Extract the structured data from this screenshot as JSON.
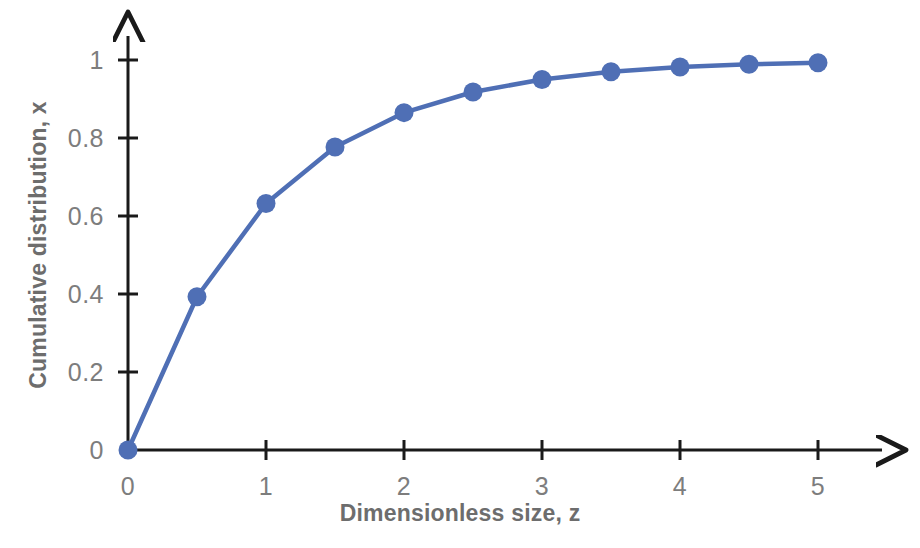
{
  "chart_data": {
    "type": "line",
    "title": "",
    "xlabel": "Dimensionless size, z",
    "ylabel": "Cumulative distribution, x",
    "x": [
      0,
      0.5,
      1,
      1.5,
      2,
      2.5,
      3,
      3.5,
      4,
      4.5,
      5
    ],
    "values": [
      0,
      0.393,
      0.632,
      0.777,
      0.865,
      0.918,
      0.95,
      0.97,
      0.982,
      0.989,
      0.993
    ],
    "series": [
      {
        "name": "Cumulative distribution",
        "values": [
          0,
          0.393,
          0.632,
          0.777,
          0.865,
          0.918,
          0.95,
          0.97,
          0.982,
          0.989,
          0.993
        ]
      }
    ],
    "xlim": [
      0,
      5
    ],
    "ylim": [
      0,
      1
    ],
    "xticks": [
      0,
      1,
      2,
      3,
      4,
      5
    ],
    "yticks": [
      0,
      0.2,
      0.4,
      0.6,
      0.8,
      1
    ],
    "xtick_labels": [
      "0",
      "1",
      "2",
      "3",
      "4",
      "5"
    ],
    "ytick_labels": [
      "0",
      "0.2",
      "0.4",
      "0.6",
      "0.8",
      "1"
    ],
    "grid": false,
    "legend": false,
    "legend_position": "none",
    "marker": "circle",
    "line_color": "#4f6fb5",
    "marker_color": "#4f6fb5",
    "axis_color": "#1a1a1a",
    "tick_label_color": "#7d7d7d",
    "axis_title_color": "#6d6d6d",
    "background_color": "#ffffff",
    "axis_arrows": true,
    "annotations": []
  },
  "axes": {
    "x_title": "Dimensionless size, z",
    "y_title": "Cumulative distribution, x"
  }
}
